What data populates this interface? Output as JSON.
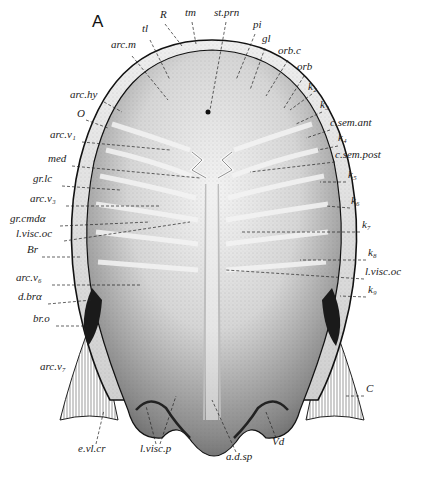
{
  "figure": {
    "panel_letter": "A",
    "colors": {
      "ink": "#222222",
      "background": "#ffffff",
      "shield_light": "#e9e9e9",
      "shield_dark": "#6e6e6e"
    }
  },
  "labels": {
    "top": [
      {
        "text": "tl",
        "x": 142,
        "y": 32
      },
      {
        "text": "R",
        "x": 160,
        "y": 18
      },
      {
        "text": "tm",
        "x": 185,
        "y": 16
      },
      {
        "text": "st.prn",
        "x": 214,
        "y": 16
      },
      {
        "text": "pi",
        "x": 253,
        "y": 28
      },
      {
        "text": "gl",
        "x": 262,
        "y": 42
      }
    ],
    "left": [
      {
        "text": "arc.m",
        "x": 111,
        "y": 48
      },
      {
        "text": "arc.hy",
        "x": 70,
        "y": 98
      },
      {
        "text": "O",
        "x": 77,
        "y": 117
      },
      {
        "text": "arc.v₁",
        "x": 50,
        "y": 138
      },
      {
        "text": "med",
        "x": 48,
        "y": 162
      },
      {
        "text": "gr.lc",
        "x": 33,
        "y": 182
      },
      {
        "text": "arc.v₃",
        "x": 30,
        "y": 202
      },
      {
        "text": "gr.cmdα",
        "x": 10,
        "y": 222
      },
      {
        "text": "l.visc.oc",
        "x": 16,
        "y": 237
      },
      {
        "text": "Br",
        "x": 27,
        "y": 253
      },
      {
        "text": "arc.v₆",
        "x": 16,
        "y": 281
      },
      {
        "text": "d.brα",
        "x": 18,
        "y": 300
      },
      {
        "text": "br.o",
        "x": 33,
        "y": 322
      },
      {
        "text": "arc.v₇",
        "x": 40,
        "y": 370
      }
    ],
    "right": [
      {
        "text": "orb.c",
        "x": 278,
        "y": 54
      },
      {
        "text": "orb",
        "x": 297,
        "y": 70
      },
      {
        "text": "k₂",
        "x": 308,
        "y": 90
      },
      {
        "text": "k₃",
        "x": 320,
        "y": 108
      },
      {
        "text": "c.sem.ant",
        "x": 330,
        "y": 126
      },
      {
        "text": "k₄",
        "x": 338,
        "y": 141
      },
      {
        "text": "c.sem.post",
        "x": 335,
        "y": 158
      },
      {
        "text": "k₅",
        "x": 348,
        "y": 178
      },
      {
        "text": "k₆",
        "x": 351,
        "y": 204
      },
      {
        "text": "k₇",
        "x": 362,
        "y": 228
      },
      {
        "text": "k₈",
        "x": 368,
        "y": 256
      },
      {
        "text": "l.visc.oc",
        "x": 365,
        "y": 275
      },
      {
        "text": "k₉",
        "x": 368,
        "y": 293
      },
      {
        "text": "C",
        "x": 366,
        "y": 392
      }
    ],
    "bottom": [
      {
        "text": "e.vl.cr",
        "x": 78,
        "y": 452
      },
      {
        "text": "l.visc.p",
        "x": 140,
        "y": 452
      },
      {
        "text": "a.d.sp",
        "x": 226,
        "y": 460
      },
      {
        "text": "Vd",
        "x": 272,
        "y": 445
      }
    ],
    "center": [
      {
        "text": "med",
        "x": 48,
        "y": 162
      }
    ]
  }
}
